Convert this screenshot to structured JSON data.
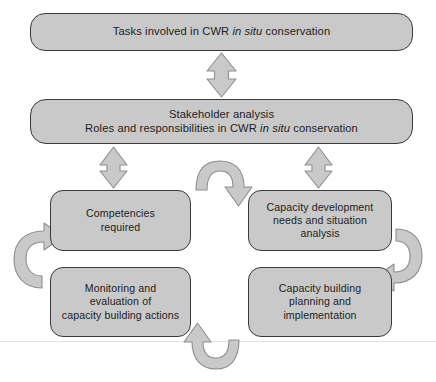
{
  "diagram": {
    "type": "cycle-flowchart",
    "title_text": "Tasks involved in CWR in situ conservation",
    "colors": {
      "node_fill": "#c9c9c9",
      "node_border": "#3a3a3a",
      "arrow_fill": "#c9c9c9",
      "arrow_border": "#8e8e8e",
      "text": "#1d1d1d",
      "background": "#ffffff"
    },
    "nodes": {
      "tasks": {
        "id": "tasks",
        "lines": [
          {
            "pre": "Tasks involved in CWR ",
            "italic": "in situ",
            "post": " conservation"
          }
        ]
      },
      "stakeholder": {
        "id": "stakeholder",
        "lines": [
          {
            "pre": "Stakeholder analysis",
            "italic": "",
            "post": ""
          },
          {
            "pre": "Roles and responsibilities in CWR ",
            "italic": "in situ",
            "post": " conservation"
          }
        ]
      },
      "competencies": {
        "id": "competencies",
        "lines": [
          {
            "pre": "Competencies",
            "italic": "",
            "post": ""
          },
          {
            "pre": "required",
            "italic": "",
            "post": ""
          }
        ]
      },
      "capacity_development": {
        "id": "capacity_development",
        "lines": [
          {
            "pre": "Capacity development",
            "italic": "",
            "post": ""
          },
          {
            "pre": "needs and situation",
            "italic": "",
            "post": ""
          },
          {
            "pre": "analysis",
            "italic": "",
            "post": ""
          }
        ]
      },
      "monitoring": {
        "id": "monitoring",
        "lines": [
          {
            "pre": "Monitoring and",
            "italic": "",
            "post": ""
          },
          {
            "pre": "evaluation of",
            "italic": "",
            "post": ""
          },
          {
            "pre": "capacity building actions",
            "italic": "",
            "post": ""
          }
        ]
      },
      "capacity_building": {
        "id": "capacity_building",
        "lines": [
          {
            "pre": "Capacity building",
            "italic": "",
            "post": ""
          },
          {
            "pre": "planning and",
            "italic": "",
            "post": ""
          },
          {
            "pre": "implementation",
            "italic": "",
            "post": ""
          }
        ]
      }
    },
    "connectors": [
      {
        "id": "tasks-stakeholder",
        "kind": "double-headed-vertical-arrow",
        "from": "tasks",
        "to": "stakeholder"
      },
      {
        "id": "stakeholder-competencies",
        "kind": "double-headed-vertical-arrow",
        "from": "stakeholder",
        "to": "competencies"
      },
      {
        "id": "stakeholder-capacity-development",
        "kind": "double-headed-vertical-arrow",
        "from": "stakeholder",
        "to": "capacity_development"
      },
      {
        "id": "competencies-to-capacity-development",
        "kind": "curved-arrow",
        "from": "competencies",
        "to": "capacity_development",
        "direction": "left-to-right-over-top"
      },
      {
        "id": "capacity-development-to-capacity-building",
        "kind": "curved-arrow",
        "from": "capacity_development",
        "to": "capacity_building",
        "direction": "top-to-bottom-around-right"
      },
      {
        "id": "capacity-building-to-monitoring",
        "kind": "curved-arrow",
        "from": "capacity_building",
        "to": "monitoring",
        "direction": "right-to-left-under-bottom"
      },
      {
        "id": "monitoring-to-competencies",
        "kind": "curved-arrow",
        "from": "monitoring",
        "to": "competencies",
        "direction": "bottom-to-top-around-left"
      }
    ]
  }
}
